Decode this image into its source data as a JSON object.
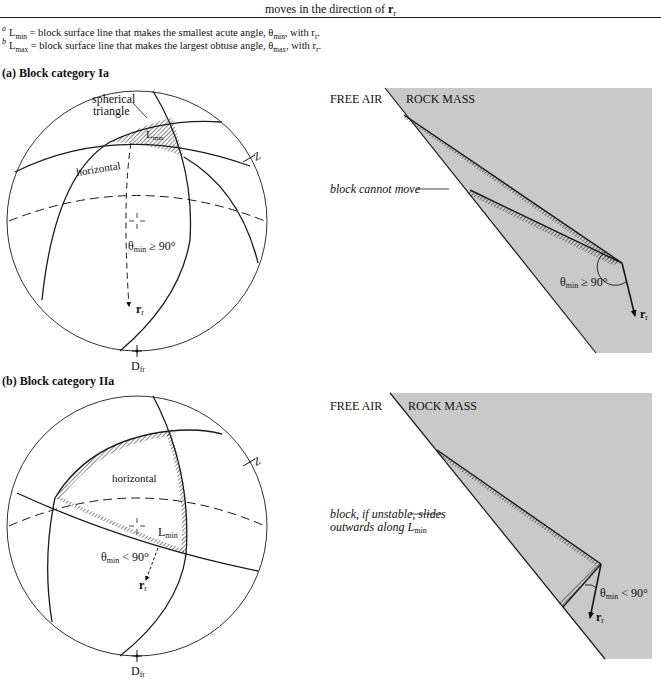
{
  "caption": {
    "text": "moves in the direction of ",
    "symbol": "r",
    "symbol_sub": "r"
  },
  "footnotes": [
    {
      "marker": "a",
      "term": "L",
      "term_sub": "min",
      "text": " = block surface line that makes the smallest acute angle, θ",
      "angle_sub": "min",
      "tail": ", with r",
      "tail_sub": "r",
      "end": "."
    },
    {
      "marker": "b",
      "term": "L",
      "term_sub": "max",
      "text": " = block surface line that makes the largest obtuse angle, θ",
      "angle_sub": "max",
      "tail": ", with r",
      "tail_sub": "r",
      "end": "."
    }
  ],
  "panels": [
    {
      "title": "(a) Block category Ia",
      "stereonet": {
        "label_spherical": "spherical",
        "label_triangle": "triangle",
        "label_lmin": "L",
        "label_lmin_sub": "min",
        "label_horizontal": "horizontal",
        "label_z": "Z",
        "label_theta": "θ",
        "label_theta_sub": "min",
        "label_theta_rel": " ≥ 90°",
        "label_rr": "r",
        "label_rr_sub": "r",
        "label_dfr": "D",
        "label_dfr_sub": "fr"
      },
      "section": {
        "free_air": "FREE AIR",
        "rock_mass": "ROCK MASS",
        "callout": "block cannot move",
        "theta": "θ",
        "theta_sub": "min",
        "theta_rel": " ≥ 90°",
        "rr": "r",
        "rr_sub": "r"
      }
    },
    {
      "title": "(b) Block category IIa",
      "stereonet": {
        "label_horizontal": "horizontal",
        "label_z": "Z",
        "label_lmin": "L",
        "label_lmin_sub": "min",
        "label_theta": "θ",
        "label_theta_sub": "min",
        "label_theta_rel": " < 90°",
        "label_rr": "r",
        "label_rr_sub": "r",
        "label_dfr": "D",
        "label_dfr_sub": "fr"
      },
      "section": {
        "free_air": "FREE AIR",
        "rock_mass": "ROCK MASS",
        "callout_line1": "block, if unstable, slides",
        "callout_line2": "outwards along L",
        "callout_line2_sub": "min",
        "theta": "θ",
        "theta_sub": "min",
        "theta_rel": " < 90°",
        "rr": "r",
        "rr_sub": "r"
      }
    }
  ],
  "colors": {
    "rock_fill": "#c9c9c9",
    "line": "#1a1a1a"
  }
}
